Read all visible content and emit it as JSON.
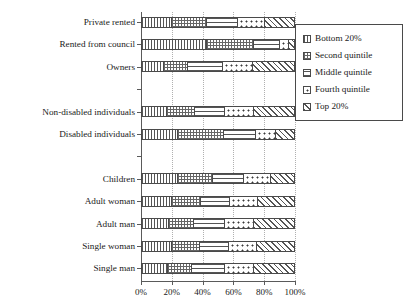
{
  "chart_data": {
    "type": "bar",
    "orientation": "horizontal",
    "stacked": true,
    "normalized": true,
    "title": "",
    "xlabel": "",
    "ylabel": "",
    "xlim": [
      0,
      100
    ],
    "grid": true,
    "legend_position": "right",
    "xtick_labels": [
      "0%",
      "20%",
      "40%",
      "60%",
      "80%",
      "100%"
    ],
    "xtick_values": [
      0,
      20,
      40,
      60,
      80,
      100
    ],
    "categories": [
      "Private rented",
      "Rented from council",
      "Owners",
      "",
      "Non-disabled individuals",
      "Disabled individuals",
      "",
      "Children",
      "Adult woman",
      "Adult man",
      "Single woman",
      "Single man"
    ],
    "series": [
      {
        "name": "Bottom 20%",
        "pattern": "vertical-lines",
        "values": [
          20,
          43,
          14.5,
          null,
          16.5,
          24,
          null,
          23.5,
          20,
          17.5,
          20,
          17
        ]
      },
      {
        "name": "Second quintile",
        "pattern": "cross-hatch-dots",
        "values": [
          23,
          31,
          15.5,
          null,
          18.5,
          30,
          null,
          23,
          19,
          16.5,
          18,
          16
        ]
      },
      {
        "name": "Middle quintile",
        "pattern": "horizontal-lines",
        "values": [
          20,
          17,
          23.5,
          null,
          19.5,
          21,
          null,
          20.5,
          19,
          20.5,
          19.5,
          21.5
        ]
      },
      {
        "name": "Fourth quintile",
        "pattern": "dots",
        "values": [
          18,
          6,
          19.5,
          null,
          19.5,
          13,
          null,
          18,
          18.5,
          19.5,
          18.5,
          19.5
        ]
      },
      {
        "name": "Top 20%",
        "pattern": "diagonal-hatch",
        "values": [
          19,
          3,
          27,
          null,
          26,
          12,
          null,
          15,
          23.5,
          26,
          24,
          26
        ]
      }
    ]
  },
  "legend": {
    "items": [
      {
        "label": "Bottom 20%"
      },
      {
        "label": "Second quintile"
      },
      {
        "label": "Middle quintile"
      },
      {
        "label": "Fourth quintile"
      },
      {
        "label": "Top 20%"
      }
    ]
  }
}
